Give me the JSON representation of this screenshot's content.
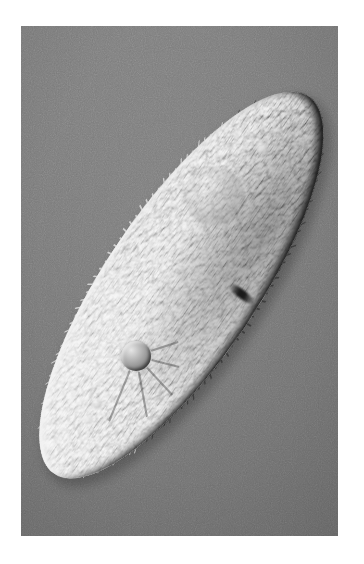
{
  "canvas": {
    "width": 364,
    "height": 564,
    "page_background": "#ffffff"
  },
  "figure": {
    "kind": "light-micrograph",
    "technique": "differential-interference-contrast",
    "frame": {
      "x": 21,
      "y": 26,
      "width": 317,
      "height": 510
    },
    "background_color": "#787878",
    "background_color_light": "#818181",
    "background_color_dark": "#6e6e6e",
    "border_color": "#ffffff",
    "grain_opacity": 0.5,
    "illumination": {
      "highlight_color": "#ffffff",
      "shadow_color": "#141414",
      "highlight_direction_deg": 315,
      "shadow_direction_deg": 135
    }
  },
  "organism": {
    "name": "paramecium",
    "shape": "elongated-ellipse",
    "center_x": 181,
    "center_y": 285,
    "length": 455,
    "width": 152,
    "rotation_deg": -56,
    "anterior_tip": {
      "x": 303,
      "y": 98
    },
    "posterior_tip": {
      "x": 66,
      "y": 468
    },
    "body_color": "#8c8c8c",
    "body_color_light": "#bdbdbd",
    "body_color_dark": "#5a5a5a",
    "rim_highlight_color": "#f2f2f2",
    "rim_shadow_color": "#1c1c1c",
    "cilia": {
      "color": "#e8e8e8",
      "shadow_color": "#2a2a2a",
      "count": 150,
      "length": 7
    }
  },
  "organelles": [
    {
      "name": "contractile-vacuole",
      "label": "contractile vacuole",
      "x": 136,
      "y": 356,
      "radius": 15,
      "fill": "#9a9a9a",
      "rim_light": "#e6e6e6",
      "rim_dark": "#454545",
      "radiating_canals": 11,
      "canal_length": 52
    },
    {
      "name": "oral-groove",
      "label": "oral groove / cytostome",
      "x": 241,
      "y": 294,
      "width": 9,
      "height": 30,
      "fill": "#1a1a1a"
    },
    {
      "name": "macronucleus-region",
      "label": "macronucleus region",
      "x": 214,
      "y": 196,
      "radius": 30,
      "fill": "#9e9e9e"
    },
    {
      "name": "food-vacuole-upper",
      "label": "food vacuole",
      "x": 262,
      "y": 148,
      "radius": 6,
      "fill": "#cfcfcf"
    },
    {
      "name": "food-vacuole-lower",
      "label": "food vacuole",
      "x": 97,
      "y": 404,
      "radius": 5,
      "fill": "#cacaca"
    },
    {
      "name": "granule-cluster-posterior",
      "label": "cytoplasmic granules",
      "x": 88,
      "y": 420,
      "radius": 4,
      "fill": "#d8d8d8"
    }
  ],
  "caption": {
    "visible": false,
    "text": ""
  }
}
